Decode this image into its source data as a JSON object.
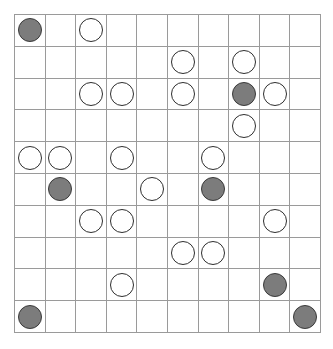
{
  "board": {
    "name": "stone-grid-board",
    "rows": 10,
    "cols": 10,
    "cell_width_px": 30.7,
    "cell_height_px": 31.9,
    "grid_line_color": "#9a9a9a",
    "background_color": "#ffffff",
    "stone_colors": {
      "white": "#ffffff",
      "white_border": "#2e2e2e",
      "gray": "#7c7c7c",
      "gray_border": "#3a3a3a"
    },
    "stone_diameter_px": 24,
    "legend": [
      {
        "key": "w",
        "label": "white-stone"
      },
      {
        "key": "g",
        "label": "gray-stone"
      },
      {
        "key": "",
        "label": "empty-cell"
      }
    ],
    "cells": [
      [
        "g",
        "",
        "w",
        "",
        "",
        "",
        "",
        "",
        "",
        ""
      ],
      [
        "",
        "",
        "",
        "",
        "",
        "w",
        "",
        "w",
        "",
        ""
      ],
      [
        "",
        "",
        "w",
        "w",
        "",
        "w",
        "",
        "g",
        "w",
        ""
      ],
      [
        "",
        "",
        "",
        "",
        "",
        "",
        "",
        "w",
        "",
        ""
      ],
      [
        "w",
        "w",
        "",
        "w",
        "",
        "",
        "w",
        "",
        "",
        ""
      ],
      [
        "",
        "g",
        "",
        "",
        "w",
        "",
        "g",
        "",
        "",
        ""
      ],
      [
        "",
        "",
        "w",
        "w",
        "",
        "",
        "",
        "",
        "w",
        ""
      ],
      [
        "",
        "",
        "",
        "",
        "",
        "w",
        "w",
        "",
        "",
        ""
      ],
      [
        "",
        "",
        "",
        "w",
        "",
        "",
        "",
        "",
        "g",
        ""
      ],
      [
        "g",
        "",
        "",
        "",
        "",
        "",
        "",
        "",
        "",
        "g"
      ]
    ],
    "counts": {
      "white": 18,
      "gray": 7,
      "empty": 75
    }
  }
}
